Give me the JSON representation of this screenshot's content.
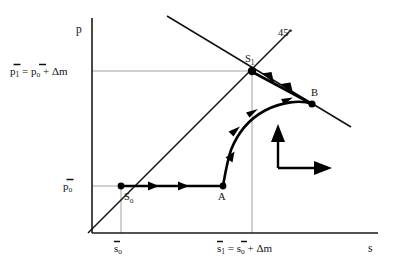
{
  "figure": {
    "type": "phase-diagram",
    "axes": {
      "y_label": "p",
      "x_label": "s"
    },
    "tick_labels": {
      "y_upper": "p̄1 = p̄0 + Δm",
      "y_upper_parts": {
        "lhs_var": "p",
        "lhs_sub": "1",
        "eq": "=",
        "rhs_var": "p",
        "rhs_sub": "o",
        "plus": "+",
        "delta": "Δm"
      },
      "y_lower": "p̄0",
      "y_lower_parts": {
        "var": "p",
        "sub": "o"
      },
      "x_left": "s̄0",
      "x_left_parts": {
        "var": "s",
        "sub": "o"
      },
      "x_right": "s̄1 = s̄0 + Δm",
      "x_right_parts": {
        "lhs_var": "s",
        "lhs_sub": "1",
        "eq": "=",
        "rhs_var": "s",
        "rhs_sub": "o",
        "plus": "+",
        "delta": "Δm"
      }
    },
    "annotations": {
      "forty_five": "45",
      "forty_five_sup": "o"
    },
    "points": [
      {
        "id": "S0",
        "var": "S",
        "sub": "o",
        "x": 121,
        "y": 186
      },
      {
        "id": "A",
        "var": "A",
        "sub": "",
        "x": 223,
        "y": 186
      },
      {
        "id": "S1",
        "var": "S",
        "sub": "1",
        "x": 252,
        "y": 71
      },
      {
        "id": "B",
        "var": "B",
        "sub": "",
        "x": 312,
        "y": 104
      }
    ],
    "curves": {
      "forty_five_line": {
        "from": [
          88,
          233
        ],
        "to": [
          290,
          31
        ]
      },
      "downward_line": {
        "from": [
          168,
          17
        ],
        "to": [
          350,
          126
        ]
      },
      "lower_path": "M121,186 L223,186",
      "rise_path": "M223,186 C226,170 228,160 233,148 C241,131 252,118 266,110 C282,101 300,100 312,104",
      "upper_path": "M312,104 L252,71"
    },
    "direction_indicator": {
      "up_arrow": true,
      "right_arrow": true
    },
    "colors": {
      "stroke": "#000000",
      "grid": "#8a8a8a",
      "background": "#ffffff"
    }
  }
}
